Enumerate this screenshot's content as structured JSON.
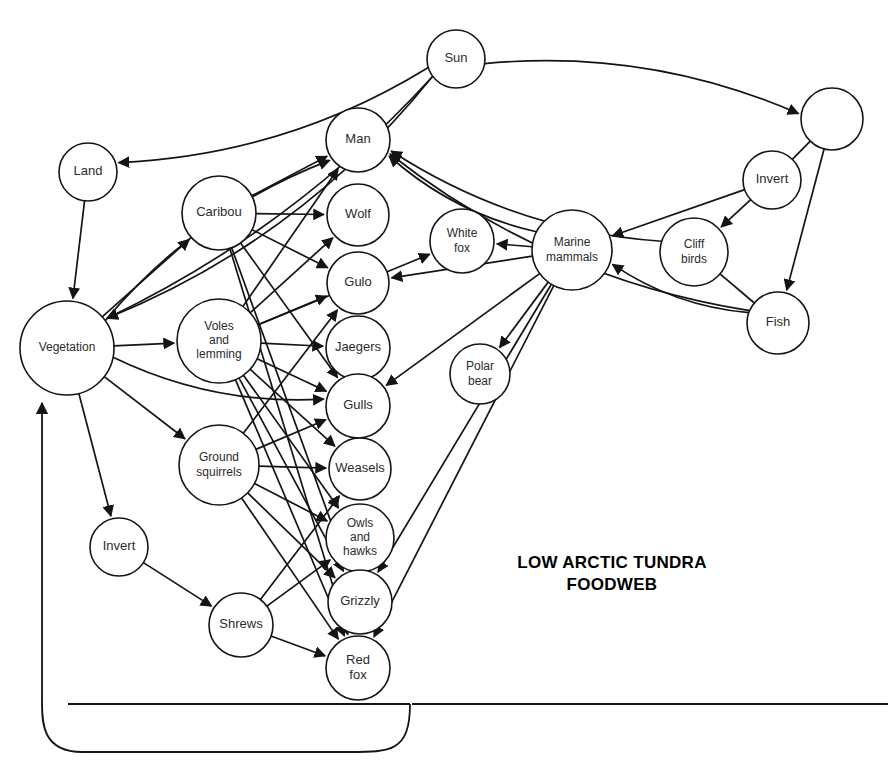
{
  "title": {
    "line1": "LOW ARCTIC TUNDRA",
    "line2": "FOODWEB",
    "x": 612,
    "y": 568
  },
  "chart_data": {
    "type": "diagram",
    "subtype": "food-web-network",
    "background": "#ffffff",
    "stroke": "#141414",
    "node_count": 22,
    "edge_count": 86,
    "nodes": [
      {
        "id": "sun",
        "label": "Sun",
        "cx": 456,
        "cy": 59,
        "r": 29,
        "lines": [
          "Sun"
        ]
      },
      {
        "id": "plankton",
        "label": "",
        "cx": 832,
        "cy": 119,
        "r": 31,
        "lines": []
      },
      {
        "id": "land",
        "label": "Land",
        "cx": 88,
        "cy": 172,
        "r": 29,
        "lines": [
          "Land"
        ]
      },
      {
        "id": "man",
        "label": "Man",
        "cx": 358,
        "cy": 140,
        "r": 32,
        "lines": [
          "Man"
        ]
      },
      {
        "id": "invert_sea",
        "label": "Invert",
        "cx": 772,
        "cy": 180,
        "r": 29,
        "lines": [
          "Invert"
        ]
      },
      {
        "id": "caribou",
        "label": "Caribou",
        "cx": 219,
        "cy": 213,
        "r": 37,
        "lines": [
          "Caribou"
        ]
      },
      {
        "id": "wolf",
        "label": "Wolf",
        "cx": 358,
        "cy": 215,
        "r": 31,
        "lines": [
          "Wolf"
        ]
      },
      {
        "id": "whitefox",
        "label": "White fox",
        "cx": 462,
        "cy": 241,
        "r": 32,
        "lines": [
          "White",
          "fox"
        ]
      },
      {
        "id": "marine",
        "label": "Marine mammals",
        "cx": 572,
        "cy": 250,
        "r": 40,
        "lines": [
          "Marine",
          "mammals"
        ]
      },
      {
        "id": "cliffbirds",
        "label": "Cliff birds",
        "cx": 694,
        "cy": 252,
        "r": 34,
        "lines": [
          "Cliff",
          "birds"
        ]
      },
      {
        "id": "gulo",
        "label": "Gulo",
        "cx": 358,
        "cy": 283,
        "r": 31,
        "lines": [
          "Gulo"
        ]
      },
      {
        "id": "fish",
        "label": "Fish",
        "cx": 778,
        "cy": 323,
        "r": 31,
        "lines": [
          "Fish"
        ]
      },
      {
        "id": "voles",
        "label": "Voles and lemming",
        "cx": 219,
        "cy": 341,
        "r": 42,
        "lines": [
          "Voles",
          "and",
          "lemming"
        ]
      },
      {
        "id": "jaegers",
        "label": "Jaegers",
        "cx": 358,
        "cy": 348,
        "r": 32,
        "lines": [
          "Jaegers"
        ]
      },
      {
        "id": "vegetation",
        "label": "Vegetation",
        "cx": 67,
        "cy": 348,
        "r": 47,
        "lines": [
          "Vegetation"
        ]
      },
      {
        "id": "polarbear",
        "label": "Polar bear",
        "cx": 480,
        "cy": 374,
        "r": 30,
        "lines": [
          "Polar",
          "bear"
        ]
      },
      {
        "id": "gulls",
        "label": "Gulls",
        "cx": 358,
        "cy": 406,
        "r": 32,
        "lines": [
          "Gulls"
        ]
      },
      {
        "id": "groundsq",
        "label": "Ground squirrels",
        "cx": 219,
        "cy": 465,
        "r": 40,
        "lines": [
          "Ground",
          "squirrels"
        ]
      },
      {
        "id": "weasels",
        "label": "Weasels",
        "cx": 360,
        "cy": 469,
        "r": 31,
        "lines": [
          "Weasels"
        ]
      },
      {
        "id": "owls",
        "label": "Owls and hawks",
        "cx": 360,
        "cy": 538,
        "r": 34,
        "lines": [
          "Owls",
          "and",
          "hawks"
        ]
      },
      {
        "id": "invert_land",
        "label": "Invert",
        "cx": 119,
        "cy": 547,
        "r": 29,
        "lines": [
          "Invert"
        ]
      },
      {
        "id": "grizzly",
        "label": "Grizzly",
        "cx": 360,
        "cy": 602,
        "r": 32,
        "lines": [
          "Grizzly"
        ]
      },
      {
        "id": "shrews",
        "label": "Shrews",
        "cx": 241,
        "cy": 625,
        "r": 32,
        "lines": [
          "Shrews"
        ]
      },
      {
        "id": "redfox",
        "label": "Red fox",
        "cx": 358,
        "cy": 668,
        "r": 32,
        "lines": [
          "Red",
          "fox"
        ]
      }
    ],
    "edges": [
      {
        "from": "sun",
        "to": "land",
        "type": "curve",
        "arrow": true
      },
      {
        "from": "sun",
        "to": "vegetation",
        "type": "curve",
        "arrow": true
      },
      {
        "from": "sun",
        "to": "vegetation",
        "type": "curve",
        "arrow": true
      },
      {
        "from": "sun",
        "to": "plankton",
        "type": "curve",
        "arrow": true
      },
      {
        "from": "land",
        "to": "vegetation",
        "type": "line",
        "arrow": true
      },
      {
        "from": "vegetation",
        "to": "caribou",
        "type": "line",
        "arrow": true
      },
      {
        "from": "vegetation",
        "to": "voles",
        "type": "line",
        "arrow": true
      },
      {
        "from": "vegetation",
        "to": "groundsq",
        "type": "line",
        "arrow": true
      },
      {
        "from": "vegetation",
        "to": "invert_land",
        "type": "line",
        "arrow": true
      },
      {
        "from": "vegetation",
        "to": "man",
        "type": "curve",
        "arrow": true
      },
      {
        "from": "vegetation",
        "to": "gulls",
        "type": "curve",
        "arrow": true
      },
      {
        "from": "caribou",
        "to": "man",
        "type": "line",
        "arrow": true
      },
      {
        "from": "caribou",
        "to": "wolf",
        "type": "line",
        "arrow": true
      },
      {
        "from": "caribou",
        "to": "gulo",
        "type": "line",
        "arrow": true
      },
      {
        "from": "caribou",
        "to": "gulls",
        "type": "line",
        "arrow": true
      },
      {
        "from": "caribou",
        "to": "grizzly",
        "type": "line",
        "arrow": true
      },
      {
        "from": "caribou",
        "to": "redfox",
        "type": "line",
        "arrow": true
      },
      {
        "from": "voles",
        "to": "man",
        "type": "line",
        "arrow": true
      },
      {
        "from": "voles",
        "to": "wolf",
        "type": "line",
        "arrow": true
      },
      {
        "from": "voles",
        "to": "gulo",
        "type": "line",
        "arrow": true
      },
      {
        "from": "voles",
        "to": "jaegers",
        "type": "line",
        "arrow": true
      },
      {
        "from": "voles",
        "to": "gulls",
        "type": "line",
        "arrow": true
      },
      {
        "from": "voles",
        "to": "weasels",
        "type": "line",
        "arrow": true
      },
      {
        "from": "voles",
        "to": "owls",
        "type": "line",
        "arrow": true
      },
      {
        "from": "voles",
        "to": "grizzly",
        "type": "line",
        "arrow": true
      },
      {
        "from": "voles",
        "to": "redfox",
        "type": "line",
        "arrow": true
      },
      {
        "from": "voles",
        "to": "whitefox",
        "type": "line",
        "arrow": true
      },
      {
        "from": "groundsq",
        "to": "weasels",
        "type": "line",
        "arrow": true
      },
      {
        "from": "groundsq",
        "to": "gulo",
        "type": "line",
        "arrow": true
      },
      {
        "from": "groundsq",
        "to": "owls",
        "type": "line",
        "arrow": true
      },
      {
        "from": "groundsq",
        "to": "grizzly",
        "type": "line",
        "arrow": true
      },
      {
        "from": "groundsq",
        "to": "redfox",
        "type": "line",
        "arrow": true
      },
      {
        "from": "groundsq",
        "to": "gulls",
        "type": "line",
        "arrow": true
      },
      {
        "from": "invert_land",
        "to": "shrews",
        "type": "line",
        "arrow": true
      },
      {
        "from": "shrews",
        "to": "owls",
        "type": "line",
        "arrow": true
      },
      {
        "from": "shrews",
        "to": "weasels",
        "type": "line",
        "arrow": true
      },
      {
        "from": "shrews",
        "to": "redfox",
        "type": "line",
        "arrow": true
      },
      {
        "from": "marine",
        "to": "man",
        "type": "curve",
        "arrow": true
      },
      {
        "from": "marine",
        "to": "polarbear",
        "type": "line",
        "arrow": true
      },
      {
        "from": "marine",
        "to": "whitefox",
        "type": "line",
        "arrow": true
      },
      {
        "from": "marine",
        "to": "gulo",
        "type": "line",
        "arrow": true
      },
      {
        "from": "marine",
        "to": "gulls",
        "type": "line",
        "arrow": true
      },
      {
        "from": "marine",
        "to": "grizzly",
        "type": "line",
        "arrow": true
      },
      {
        "from": "marine",
        "to": "redfox",
        "type": "line",
        "arrow": true
      },
      {
        "from": "fish",
        "to": "marine",
        "type": "curve",
        "arrow": true
      },
      {
        "from": "fish",
        "to": "man",
        "type": "curve",
        "arrow": true
      },
      {
        "from": "cliffbirds",
        "to": "fish",
        "type": "line",
        "arrow": false
      },
      {
        "from": "cliffbirds",
        "to": "man",
        "type": "curve",
        "arrow": true
      },
      {
        "from": "invert_sea",
        "to": "cliffbirds",
        "type": "line",
        "arrow": true
      },
      {
        "from": "invert_sea",
        "to": "marine",
        "type": "line",
        "arrow": true
      },
      {
        "from": "plankton",
        "to": "fish",
        "type": "line",
        "arrow": true
      },
      {
        "from": "plankton",
        "to": "invert_sea",
        "type": "line",
        "arrow": false
      },
      {
        "from": "detritus",
        "to": "vegetation",
        "type": "loop",
        "arrow": true
      }
    ],
    "detritus_line": {
      "y": 704,
      "x_start": 68,
      "x_end": 410,
      "x_end2": 888,
      "loop_left_x": 42,
      "loop_bottom_y": 752
    }
  }
}
